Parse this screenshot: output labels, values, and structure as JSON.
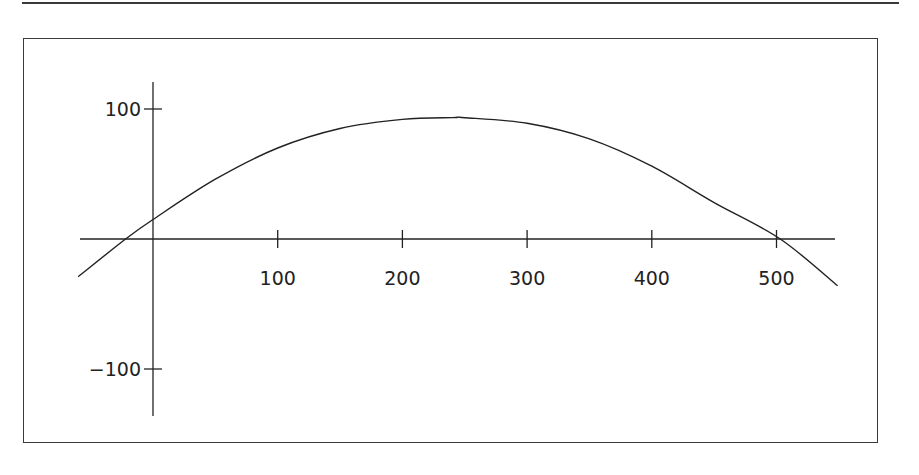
{
  "chart_data": {
    "type": "line",
    "title": "",
    "xlabel": "",
    "ylabel": "",
    "xlim": [
      -60,
      550
    ],
    "ylim": [
      -130,
      105
    ],
    "grid": false,
    "legend": "none",
    "x_ticks": [
      100,
      200,
      300,
      400,
      500
    ],
    "x_tick_labels": [
      "100",
      "200",
      "300",
      "400",
      "500"
    ],
    "y_ticks": [
      100,
      -100
    ],
    "y_tick_labels": [
      "100",
      "−100"
    ],
    "series": [
      {
        "name": "curve",
        "color": "#222222",
        "x": [
          -60,
          -22,
          0,
          50,
          100,
          150,
          200,
          240,
          250,
          300,
          350,
          400,
          450,
          503,
          549
        ],
        "y": [
          -29,
          0,
          15,
          46,
          70,
          85,
          92,
          93.4,
          93.3,
          89,
          77,
          56,
          28,
          0,
          -36
        ]
      }
    ]
  }
}
